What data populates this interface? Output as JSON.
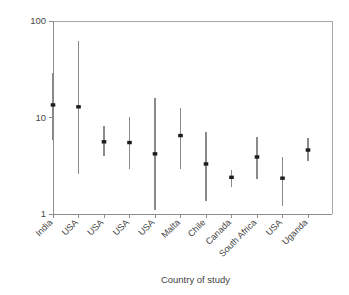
{
  "chart_data": {
    "type": "scatter",
    "title": "",
    "subtitle": "",
    "xlabel": "Country of study",
    "ylabel": "",
    "yscale": "log",
    "ylim": [
      1,
      100
    ],
    "ytick_labels": [
      "1",
      "10",
      "100"
    ],
    "ytick_values": [
      1,
      10,
      100
    ],
    "grid": false,
    "legend": null,
    "categories": [
      "India",
      "USA",
      "USA",
      "USA",
      "USA",
      "Malta",
      "Chile",
      "Canada",
      "South Africa",
      "USA",
      "Uganda"
    ],
    "series": [
      {
        "name": "Effect estimate",
        "values": [
          13.5,
          12.9,
          5.6,
          5.5,
          4.2,
          6.5,
          3.3,
          2.4,
          3.9,
          2.35,
          4.6
        ],
        "ci_lower": [
          5.9,
          2.6,
          4.0,
          2.9,
          1.1,
          2.9,
          1.35,
          1.9,
          2.3,
          1.2,
          3.5
        ],
        "ci_upper": [
          29.0,
          62.0,
          8.2,
          10.2,
          16.0,
          12.5,
          7.0,
          2.85,
          6.3,
          3.9,
          6.2
        ]
      }
    ],
    "marker": "square",
    "error_bar_style": "vertical-line",
    "colors": {
      "marker": "#1c1c1c",
      "error_bar": "#8a8a8a",
      "axis": "#8d8d8d",
      "frame": "#a8a8a8",
      "text": "#3f3f3f",
      "background": "#ffffff"
    }
  },
  "axis": {
    "x_title": "Country of study"
  }
}
